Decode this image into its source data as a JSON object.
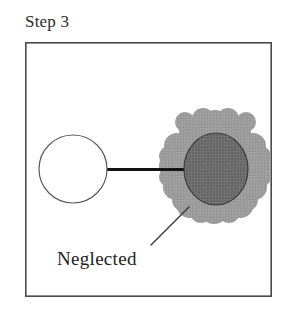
{
  "figure": {
    "title": "Step 3",
    "frame": {
      "x": 25,
      "y": 42,
      "width": 247,
      "height": 255,
      "stroke": "#4a4a4a",
      "stroke_width": 1.6,
      "fill": "#ffffff"
    },
    "nodes": [
      {
        "id": "clean-node",
        "shape": "circle",
        "label": "",
        "cx": 73,
        "cy": 169,
        "r": 34,
        "fill": "#ffffff",
        "stroke": "#5a5a5a",
        "stroke_width": 1.2
      },
      {
        "id": "neglected-node",
        "shape": "circle",
        "label": "",
        "cx": 216,
        "cy": 169,
        "rx": 32,
        "ry": 36,
        "fill": "#6e6e6e",
        "stroke": "#3c3c3c",
        "stroke_width": 1.2
      }
    ],
    "cloud": {
      "id": "neglect-cloud",
      "fill": "#9c9c9c",
      "bounds": {
        "x": 166,
        "y": 112,
        "width": 97,
        "height": 111
      },
      "cx": 215,
      "cy": 168
    },
    "connector": {
      "id": "link-line",
      "x1": 106,
      "y1": 169,
      "x2": 190,
      "y2": 169,
      "stroke": "#131313",
      "stroke_width": 3.2
    },
    "callout": {
      "label": "Neglected",
      "label_x": 57,
      "label_y": 265,
      "leader": {
        "x1": 151,
        "y1": 245,
        "x2": 189,
        "y2": 207,
        "stroke": "#3a3a3a",
        "stroke_width": 1.4
      }
    },
    "colors": {
      "background": "#ffffff",
      "ink": "#222222",
      "cloud_gray": "#9c9c9c",
      "node_gray": "#6e6e6e",
      "frame_gray": "#4a4a4a"
    }
  }
}
